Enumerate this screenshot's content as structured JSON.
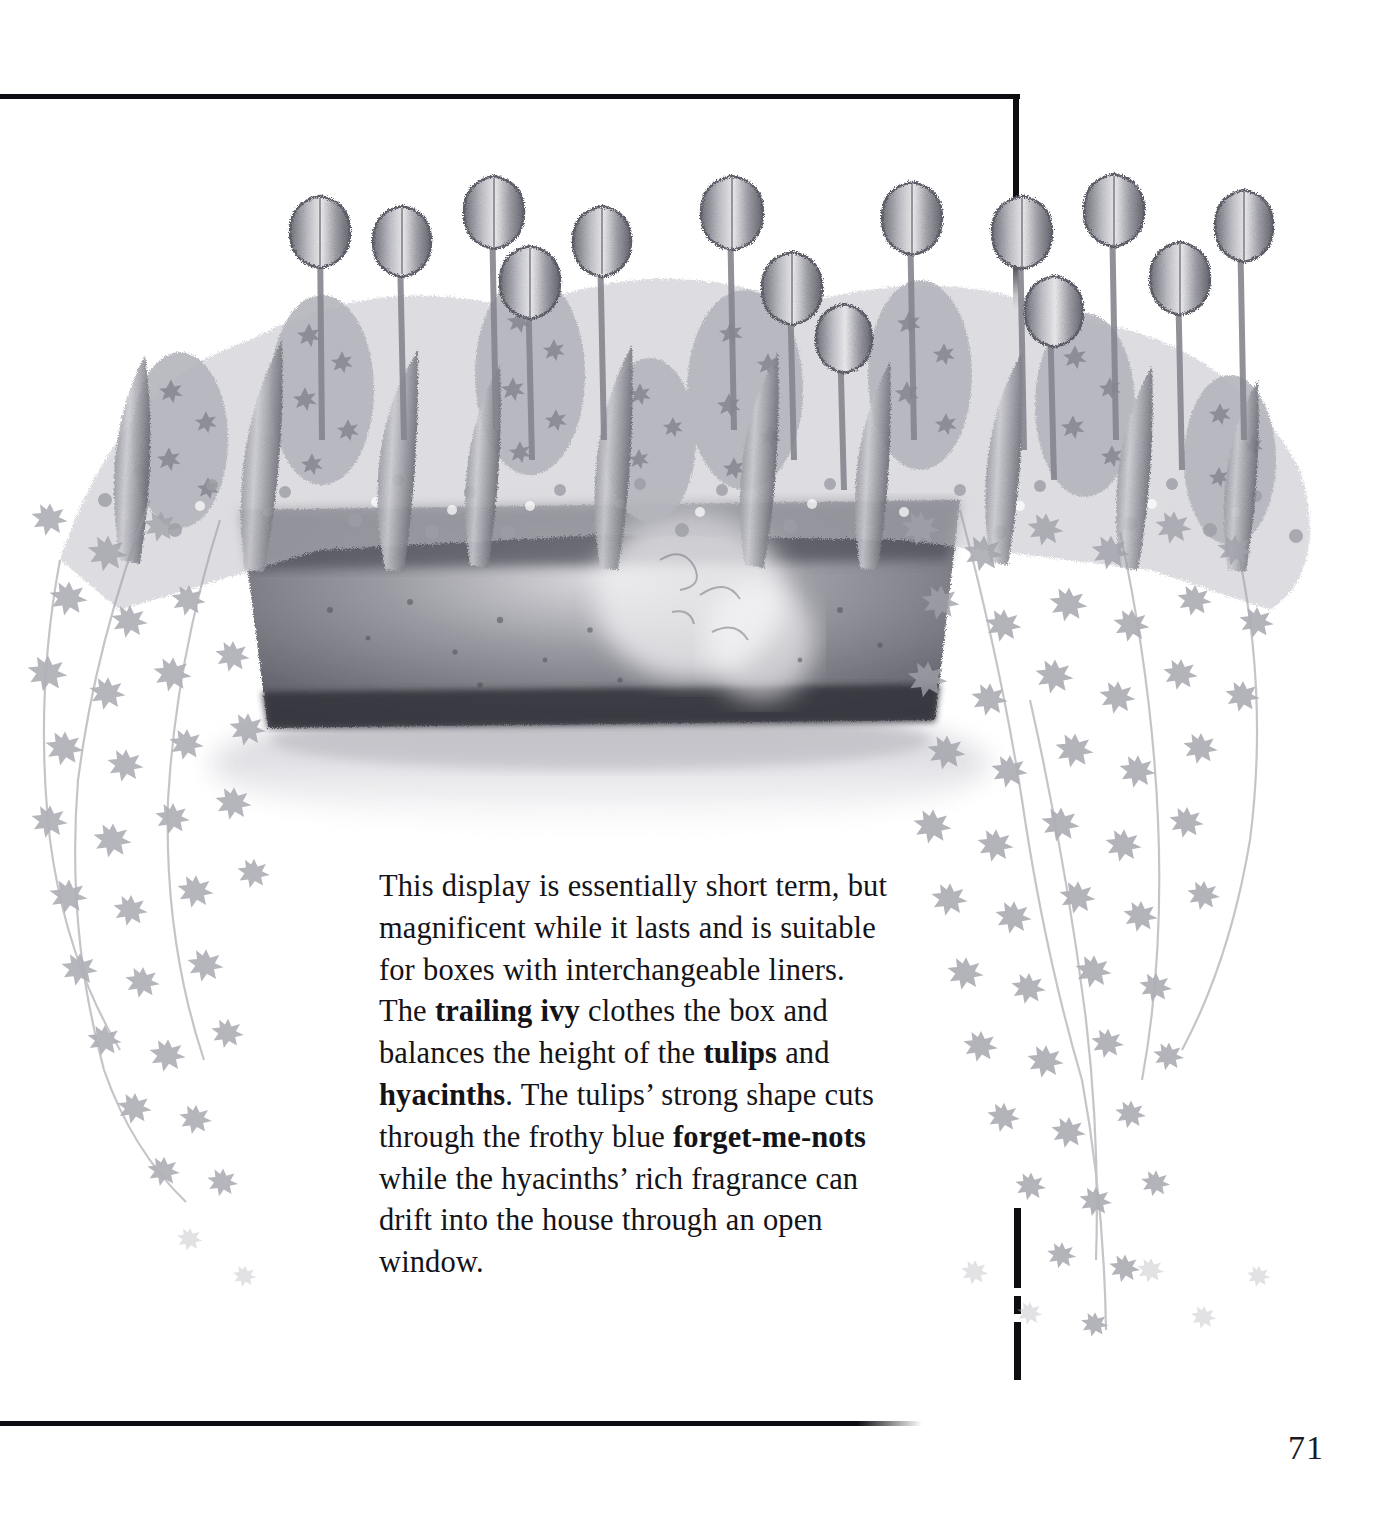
{
  "page": {
    "number": "71",
    "background_color": "#ffffff",
    "rule_color": "#0d0d12"
  },
  "illustration": {
    "name": "window-box-spring-display-illustration",
    "medium": "pencil drawing, monochrome grayscale",
    "subject": "Window box planted with tulips, hyacinths, forget-me-nots and trailing ivy",
    "palette": {
      "paper": "#ffffff",
      "light_pencil": "#d3d3d6",
      "mid_pencil": "#a7a7ad",
      "dark_pencil": "#6e6e76",
      "deepest_shadow": "#3c3c45",
      "box_body": "#8c8c94",
      "box_shadow": "#4a4a54"
    },
    "elements": [
      {
        "name": "tulips",
        "count": 14,
        "note": "upright cup-shaped blooms rising above the mass"
      },
      {
        "name": "hyacinths",
        "count": 8,
        "note": "dense conical flower spikes"
      },
      {
        "name": "forget-me-nots",
        "note": "frothy speckled filler between the bulbs"
      },
      {
        "name": "trailing-ivy",
        "note": "cascading curtains of ivy on both sides of the box"
      },
      {
        "name": "window-box-container",
        "note": "dark rectangular trough with shadowed interior"
      },
      {
        "name": "cast-shadow",
        "note": "soft ground shadow beneath the box"
      }
    ]
  },
  "caption": {
    "name": "display-description",
    "runs": [
      {
        "text": "This display is essentially short term, but magnificent while it lasts and is suitable for boxes with interchangeable liners. The ",
        "bold": false
      },
      {
        "text": "trailing ivy",
        "bold": true
      },
      {
        "text": " clothes the box and balances the height of the ",
        "bold": false
      },
      {
        "text": "tulips",
        "bold": true
      },
      {
        "text": " and ",
        "bold": false
      },
      {
        "text": "hyacinths",
        "bold": true
      },
      {
        "text": ". The tulips’ strong shape cuts through the frothy blue ",
        "bold": false
      },
      {
        "text": "forget-me-nots",
        "bold": true
      },
      {
        "text": " while the hyacinths’ rich fragrance can drift into the house through an open window.",
        "bold": false
      }
    ],
    "plain_text": "This display is essentially short term, but magnificent while it lasts and is suitable for boxes with interchangeable liners. The trailing ivy clothes the box and balances the height of the tulips and hyacinths. The tulips’ strong shape cuts through the frothy blue forget-me-nots while the hyacinths’ rich fragrance can drift into the house through an open window."
  }
}
